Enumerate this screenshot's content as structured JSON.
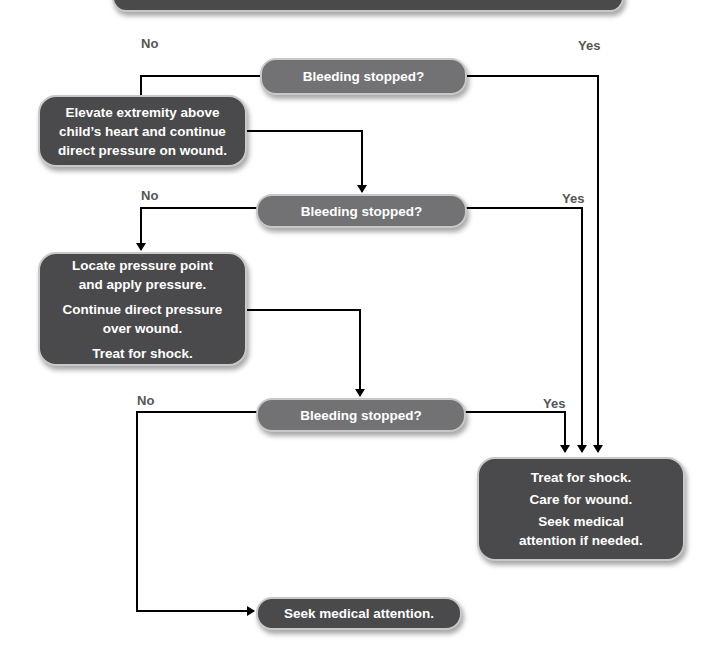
{
  "flowchart": {
    "top_box_partial": "",
    "decisions": [
      {
        "label": "Bleeding stopped?",
        "no": "No",
        "yes": "Yes"
      },
      {
        "label": "Bleeding stopped?",
        "no": "No",
        "yes": "Yes"
      },
      {
        "label": "Bleeding stopped?",
        "no": "No",
        "yes": "Yes"
      }
    ],
    "step_elevate": {
      "lines": [
        "Elevate extremity above",
        "child’s heart and continue",
        "direct pressure on wound."
      ]
    },
    "step_pressure_point": {
      "paragraphs": [
        [
          "Locate pressure point",
          "and apply pressure."
        ],
        [
          "Continue direct pressure",
          "over wound."
        ],
        [
          "Treat for shock."
        ]
      ]
    },
    "outcome_stopped": {
      "lines": [
        "Treat for shock.",
        "Care for wound.",
        "Seek medical",
        "attention if needed."
      ]
    },
    "outcome_not_stopped": "Seek medical attention.",
    "colors": {
      "box": "#4a4a4c",
      "decision": "#727274",
      "border": "#c8c8c8",
      "line": "#000000"
    }
  }
}
